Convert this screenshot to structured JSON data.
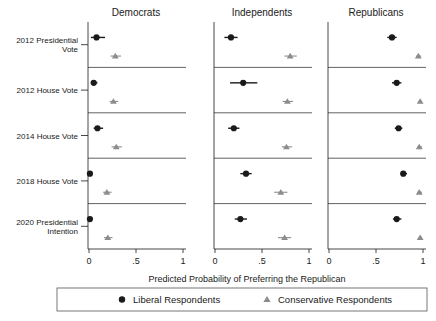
{
  "chart_data": {
    "type": "scatter",
    "title": "",
    "xlabel": "Predicted Probability of Preferring the Republican",
    "ylabel": "",
    "xlim": [
      0,
      1
    ],
    "xticks": [
      0,
      0.5,
      1
    ],
    "xticklabels": [
      "0",
      ".5",
      "1"
    ],
    "grid": false,
    "legend_position": "bottom",
    "panels": [
      "Democrats",
      "Independents",
      "Republicans"
    ],
    "rows": [
      "2012 Presidential Vote",
      "2012 House Vote",
      "2014 House Vote",
      "2018 House Vote",
      "2020 Presidential Intention"
    ],
    "series": [
      {
        "name": "Liberal Respondents",
        "marker": "circle",
        "color": "#1a1a1a",
        "values": {
          "Democrats": [
            0.08,
            0.05,
            0.09,
            0.01,
            0.01
          ],
          "Independents": [
            0.17,
            0.3,
            0.2,
            0.33,
            0.27
          ],
          "Republicans": [
            0.67,
            0.72,
            0.74,
            0.79,
            0.72
          ]
        },
        "ci_low": {
          "Democrats": [
            0.02,
            0.02,
            0.05,
            0.0,
            0.0
          ],
          "Independents": [
            0.1,
            0.16,
            0.14,
            0.27,
            0.21
          ],
          "Republicans": [
            0.62,
            0.67,
            0.7,
            0.76,
            0.68
          ]
        },
        "ci_high": {
          "Democrats": [
            0.17,
            0.09,
            0.15,
            0.03,
            0.03
          ],
          "Independents": [
            0.24,
            0.45,
            0.26,
            0.39,
            0.34
          ],
          "Republicans": [
            0.72,
            0.77,
            0.78,
            0.83,
            0.77
          ]
        }
      },
      {
        "name": "Conservative Respondents",
        "marker": "triangle",
        "color": "#8c8c8c",
        "values": {
          "Democrats": [
            0.28,
            0.26,
            0.29,
            0.19,
            0.2
          ],
          "Independents": [
            0.8,
            0.77,
            0.76,
            0.7,
            0.74
          ],
          "Republicans": [
            0.95,
            0.97,
            0.96,
            0.96,
            0.97
          ]
        },
        "ci_low": {
          "Democrats": [
            0.23,
            0.22,
            0.24,
            0.15,
            0.16
          ],
          "Independents": [
            0.74,
            0.72,
            0.71,
            0.63,
            0.67
          ],
          "Republicans": [
            0.93,
            0.95,
            0.94,
            0.94,
            0.95
          ]
        },
        "ci_high": {
          "Democrats": [
            0.34,
            0.31,
            0.35,
            0.24,
            0.25
          ],
          "Independents": [
            0.87,
            0.83,
            0.82,
            0.77,
            0.81
          ],
          "Republicans": [
            0.98,
            0.99,
            0.99,
            0.99,
            0.99
          ]
        }
      }
    ]
  },
  "legend": {
    "items": [
      {
        "label": "Liberal Respondents",
        "marker": "circle",
        "color": "#1a1a1a"
      },
      {
        "label": "Conservative Respondents",
        "marker": "triangle",
        "color": "#8c8c8c"
      }
    ]
  }
}
